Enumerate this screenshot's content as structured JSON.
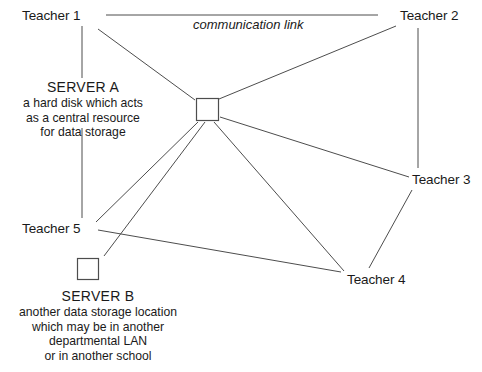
{
  "diagram": {
    "stroke_color": "#4d4d4d",
    "text_color": "#1a1a1a",
    "background": "#ffffff",
    "link_caption": "communication link",
    "nodes": [
      {
        "id": "teacher1",
        "label": "Teacher 1",
        "x": 22,
        "y": 8
      },
      {
        "id": "teacher2",
        "label": "Teacher 2",
        "x": 400,
        "y": 8
      },
      {
        "id": "teacher3",
        "label": "Teacher 3",
        "x": 412,
        "y": 172
      },
      {
        "id": "teacher4",
        "label": "Teacher 4",
        "x": 347,
        "y": 272
      },
      {
        "id": "teacher5",
        "label": "Teacher 5",
        "x": 22,
        "y": 221
      }
    ],
    "server_a": {
      "title": "SERVER A",
      "description": [
        "a hard disk which acts",
        "as a central resource",
        "for data storage"
      ],
      "box": {
        "x": 196,
        "y": 98,
        "size": 22
      }
    },
    "server_b": {
      "title": "SERVER B",
      "description": [
        "another data storage location",
        "which may be in another",
        "departmental LAN",
        "or in another school"
      ],
      "box": {
        "x": 77,
        "y": 258,
        "size": 21
      }
    },
    "edges": [
      {
        "id": "caption-rule",
        "x1": 106,
        "y1": 15,
        "x2": 378,
        "y2": 15
      },
      {
        "id": "teacher1-to-servera-text",
        "x1": 82,
        "y1": 26,
        "x2": 82,
        "y2": 78
      },
      {
        "id": "servera-text-to-teacher5",
        "x1": 82,
        "y1": 128,
        "x2": 82,
        "y2": 218
      },
      {
        "id": "teacher1-to-hub",
        "x1": 98,
        "y1": 29,
        "x2": 195,
        "y2": 100
      },
      {
        "id": "teacher2-to-hub",
        "x1": 396,
        "y1": 26,
        "x2": 219,
        "y2": 99
      },
      {
        "id": "teacher2-to-teacher3",
        "x1": 418,
        "y1": 28,
        "x2": 418,
        "y2": 168
      },
      {
        "id": "hub-to-teacher3",
        "x1": 220,
        "y1": 117,
        "x2": 409,
        "y2": 177
      },
      {
        "id": "teacher3-to-teacher4",
        "x1": 412,
        "y1": 190,
        "x2": 369,
        "y2": 268
      },
      {
        "id": "hub-to-teacher4",
        "x1": 214,
        "y1": 122,
        "x2": 344,
        "y2": 271
      },
      {
        "id": "hub-to-teacher5",
        "x1": 198,
        "y1": 122,
        "x2": 96,
        "y2": 222
      },
      {
        "id": "hub-to-serverb",
        "x1": 205,
        "y1": 122,
        "x2": 104,
        "y2": 256
      },
      {
        "id": "teacher5-to-teacher4",
        "x1": 98,
        "y1": 230,
        "x2": 341,
        "y2": 272
      }
    ]
  }
}
